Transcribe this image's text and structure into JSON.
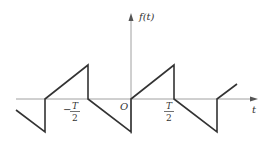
{
  "diagram": {
    "type": "waveform",
    "y_axis_label": "f(t)",
    "x_axis_label": "t",
    "origin_label": "O",
    "tick_labels": [
      {
        "sign": "−",
        "numerator": "T",
        "denominator": "2",
        "position": "-T/2"
      },
      {
        "sign": "",
        "numerator": "T",
        "denominator": "2",
        "position": "T/2"
      }
    ],
    "colors": {
      "axis": "#9a9a9a",
      "waveform": "#333333",
      "text": "#333333"
    }
  }
}
